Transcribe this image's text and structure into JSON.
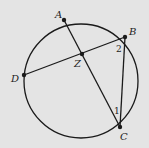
{
  "diagram": {
    "type": "circle-geometry",
    "background": "#e4e4e4",
    "stroke": "#1a1a1a",
    "circle": {
      "cx": 81,
      "cy": 86,
      "r": 60
    },
    "points": {
      "A": {
        "label": "A",
        "x": 64,
        "y": 20
      },
      "B": {
        "label": "B",
        "x": 122,
        "y": 37
      },
      "C": {
        "label": "C",
        "x": 120,
        "y": 124
      },
      "D": {
        "label": "D",
        "x": 24,
        "y": 75
      },
      "Z": {
        "label": "Z",
        "x": 82,
        "y": 54
      }
    },
    "segments": [
      "AC",
      "DB",
      "BC"
    ],
    "angles": {
      "angle1": {
        "label": "1"
      },
      "angle2": {
        "label": "2"
      }
    }
  }
}
